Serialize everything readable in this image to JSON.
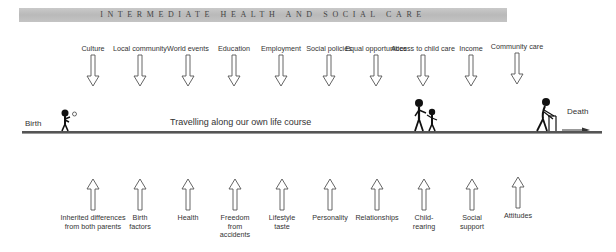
{
  "header": {
    "title": "INTERMEDIATE HEALTH AND SOCIAL CARE"
  },
  "timeline": {
    "start_label": "Birth",
    "end_label": "Death",
    "caption": "Travelling along our own life course"
  },
  "external_factors": [
    {
      "label": "Culture"
    },
    {
      "label": "Local community"
    },
    {
      "label": "World events"
    },
    {
      "label": "Education"
    },
    {
      "label": "Employment"
    },
    {
      "label": "Social policies"
    },
    {
      "label": "Equal opportunities"
    },
    {
      "label": "Access to child care"
    },
    {
      "label": "Income"
    },
    {
      "label": "Community care"
    }
  ],
  "personal_factors": [
    {
      "label": "Inherited differences from both parents"
    },
    {
      "label": "Birth factors"
    },
    {
      "label": "Health"
    },
    {
      "label": "Freedom from accidents"
    },
    {
      "label": "Lifestyle taste"
    },
    {
      "label": "Personality"
    },
    {
      "label": "Relationships"
    },
    {
      "label": "Child-rearing"
    },
    {
      "label": "Social support"
    },
    {
      "label": "Attitudes"
    }
  ],
  "figures": [
    {
      "name": "child-playing-ball",
      "stage": "Birth"
    },
    {
      "name": "adult-with-child",
      "stage": "Access to child care"
    },
    {
      "name": "elderly-with-walker",
      "stage": "Death"
    }
  ],
  "colors": {
    "banner": "#c2c2c2",
    "line": "#555555",
    "text": "#333333"
  }
}
